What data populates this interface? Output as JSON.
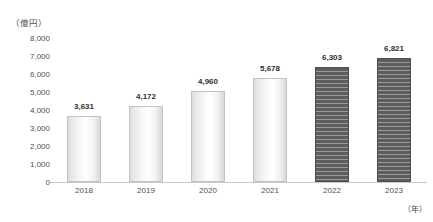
{
  "chart_data": {
    "type": "bar",
    "title": "",
    "subtitle": "",
    "categories": [
      "2018",
      "2019",
      "2020",
      "2021",
      "2022",
      "2023"
    ],
    "values": [
      3631,
      4172,
      4960,
      5678,
      6303,
      6821
    ],
    "value_labels": [
      "3,631",
      "4,172",
      "4,960",
      "5,678",
      "6,303",
      "6,821"
    ],
    "series": [
      {
        "name": "",
        "values": [
          3631,
          4172,
          4960,
          5678,
          6303,
          6821
        ],
        "styles": [
          "light",
          "light",
          "light",
          "light",
          "hatched",
          "hatched"
        ]
      }
    ],
    "xlabel": "（年）",
    "ylabel": "（億円）",
    "ylim": [
      0,
      8000
    ],
    "y_ticks": [
      8000,
      7000,
      6000,
      5000,
      4000,
      3000,
      2000,
      1000,
      0
    ],
    "y_tick_labels": [
      "8,000",
      "7,000",
      "6,000",
      "5,000",
      "4,000",
      "3,000",
      "2,000",
      "1,000",
      "0"
    ],
    "grid": false,
    "legend": null,
    "colors": {
      "bar_light_fill": "#f5f5f5",
      "bar_light_border": "#c2c2c2",
      "bar_hatched_dark": "#5d5d5d",
      "bar_hatched_stripe": "#9a9a9a",
      "axis_line": "#c9c9c9",
      "text": "#3f3f3f"
    }
  }
}
